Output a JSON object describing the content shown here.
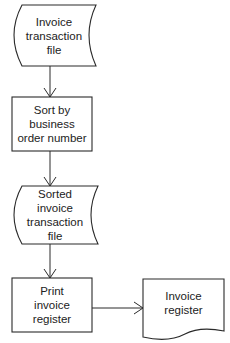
{
  "diagram": {
    "type": "flowchart",
    "nodes": [
      {
        "id": "n1",
        "shape": "stored-data",
        "lines": [
          "Invoice",
          "transaction",
          "file"
        ]
      },
      {
        "id": "n2",
        "shape": "process",
        "lines": [
          "Sort by",
          "business",
          "order number"
        ]
      },
      {
        "id": "n3",
        "shape": "stored-data",
        "lines": [
          "Sorted",
          "invoice",
          "transaction",
          "file"
        ]
      },
      {
        "id": "n4",
        "shape": "process",
        "lines": [
          "Print",
          "invoice",
          "register"
        ]
      },
      {
        "id": "n5",
        "shape": "document",
        "lines": [
          "Invoice",
          "register"
        ]
      }
    ],
    "edges": [
      {
        "from": "n1",
        "to": "n2"
      },
      {
        "from": "n2",
        "to": "n3"
      },
      {
        "from": "n3",
        "to": "n4"
      },
      {
        "from": "n4",
        "to": "n5"
      }
    ],
    "colors": {
      "stroke": "#2a2a2a",
      "text": "#222222",
      "background": "#ffffff"
    }
  }
}
